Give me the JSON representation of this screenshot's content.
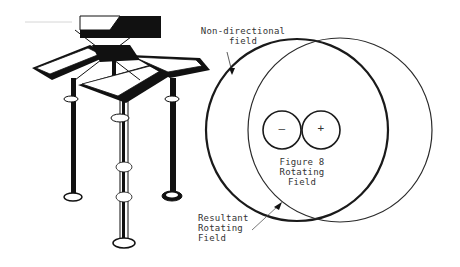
{
  "labels": {
    "non_directional_1": "Non-directional",
    "non_directional_2": "field",
    "figure8_1": "Figure 8",
    "figure8_2": "Rotating",
    "figure8_3": "Field",
    "resultant_1": "Resultant",
    "resultant_2": "Rotating",
    "resultant_3": "Field",
    "minus": "–",
    "plus": "+"
  },
  "colors": {
    "ink": "#1a1a1a",
    "background": "#ffffff"
  }
}
